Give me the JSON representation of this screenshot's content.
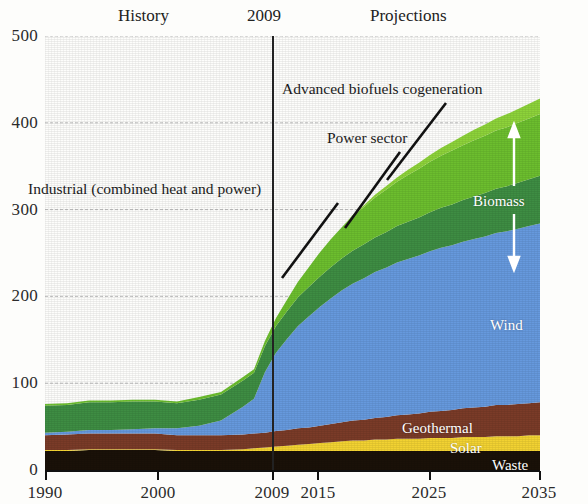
{
  "header": {
    "history_label": "History",
    "year_divider_label": "2009",
    "projections_label": "Projections"
  },
  "annotations": {
    "advanced_biofuels": "Advanced biofuels cogeneration",
    "power_sector": "Power sector",
    "industrial_chp": "Industrial (combined heat and power)",
    "biomass_bracket": "Biomass"
  },
  "inline_labels": {
    "wind": "Wind",
    "geothermal": "Geothermal",
    "solar": "Solar",
    "waste": "Waste"
  },
  "colors": {
    "advanced_biofuels_cogeneration": "#8DD33A",
    "power_sector_biomass": "#6CBE2E",
    "industrial_chp_biomass": "#3E8D43",
    "wind": "#6699DD",
    "geothermal": "#7A3B28",
    "solar": "#F2D232",
    "waste": "#1A1108",
    "axis": "#111111",
    "gridline": "#bdbdbd"
  },
  "chart_data": {
    "type": "area",
    "stacked": true,
    "title": "",
    "xlabel": "",
    "ylabel": "",
    "xlim": [
      1990,
      2035
    ],
    "ylim": [
      0,
      500
    ],
    "yticks": [
      0,
      100,
      200,
      300,
      400,
      500
    ],
    "xticks": [
      1990,
      2000,
      2009,
      2015,
      2025,
      2035
    ],
    "grid": true,
    "legend_position": "inline-labels",
    "history_projection_split_year": 2009,
    "x": [
      1990,
      1992,
      1994,
      1996,
      1998,
      2000,
      2002,
      2004,
      2006,
      2008,
      2009,
      2010,
      2011,
      2012,
      2013,
      2014,
      2015,
      2016,
      2017,
      2018,
      2019,
      2020,
      2021,
      2022,
      2023,
      2024,
      2025,
      2026,
      2027,
      2028,
      2029,
      2030,
      2031,
      2032,
      2033,
      2034,
      2035
    ],
    "series": [
      {
        "name": "Waste",
        "color": "#1A1108",
        "values": [
          22,
          22,
          23,
          23,
          23,
          23,
          22,
          22,
          22,
          22,
          22,
          22,
          22,
          22,
          22,
          22,
          22,
          22,
          22,
          22,
          22,
          22,
          22,
          22,
          22,
          22,
          22,
          22,
          22,
          22,
          22,
          22,
          22,
          22,
          22,
          22,
          22
        ]
      },
      {
        "name": "Solar",
        "color": "#F2D232",
        "values": [
          1,
          1,
          1,
          1,
          1,
          1,
          1,
          1,
          1,
          2,
          3,
          4,
          5,
          6,
          7,
          8,
          9,
          10,
          11,
          12,
          12,
          13,
          13,
          14,
          14,
          14,
          15,
          15,
          15,
          16,
          16,
          16,
          17,
          17,
          17,
          18,
          18
        ]
      },
      {
        "name": "Geothermal",
        "color": "#7A3B28",
        "values": [
          17,
          18,
          18,
          18,
          18,
          18,
          17,
          17,
          17,
          17,
          17,
          17,
          18,
          18,
          19,
          19,
          20,
          21,
          22,
          23,
          24,
          25,
          26,
          27,
          28,
          29,
          30,
          31,
          32,
          33,
          34,
          35,
          36,
          36,
          37,
          37,
          38
        ]
      },
      {
        "name": "Wind",
        "color": "#6699DD",
        "values": [
          3,
          3,
          4,
          4,
          5,
          6,
          8,
          11,
          17,
          32,
          40,
          70,
          90,
          105,
          118,
          128,
          137,
          145,
          152,
          158,
          163,
          168,
          172,
          176,
          179,
          182,
          185,
          188,
          190,
          192,
          194,
          196,
          198,
          200,
          202,
          204,
          206
        ]
      },
      {
        "name": "Industrial (combined heat and power)",
        "color": "#3E8D43",
        "values": [
          31,
          31,
          32,
          32,
          32,
          31,
          29,
          30,
          30,
          30,
          30,
          30,
          31,
          32,
          33,
          34,
          35,
          36,
          37,
          38,
          39,
          40,
          41,
          42,
          43,
          44,
          45,
          46,
          47,
          48,
          49,
          50,
          51,
          52,
          53,
          54,
          55
        ]
      },
      {
        "name": "Power sector",
        "color": "#6CBE2E",
        "values": [
          2,
          2,
          2,
          2,
          2,
          2,
          2,
          3,
          3,
          4,
          4,
          6,
          9,
          13,
          18,
          23,
          28,
          32,
          36,
          40,
          43,
          46,
          49,
          51,
          54,
          56,
          58,
          60,
          62,
          63,
          65,
          66,
          67,
          68,
          69,
          70,
          71
        ]
      },
      {
        "name": "Advanced biofuels cogeneration",
        "color": "#8DD33A",
        "values": [
          0,
          0,
          0,
          0,
          0,
          0,
          0,
          0,
          0,
          0,
          0,
          0,
          0,
          0,
          0,
          0,
          0,
          0,
          0,
          1,
          2,
          3,
          4,
          5,
          6,
          7,
          8,
          9,
          10,
          11,
          12,
          13,
          14,
          15,
          16,
          17,
          18
        ]
      }
    ],
    "series_totals_note": "Stacked total rises from about 76 in 1990 to about 408 in 2035"
  }
}
